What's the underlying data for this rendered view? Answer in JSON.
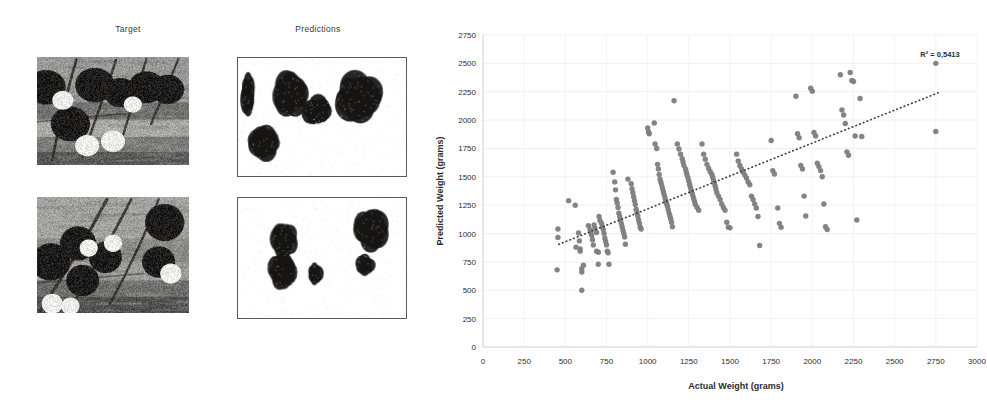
{
  "panels": {
    "columns": [
      {
        "id": "target",
        "label": "Target"
      },
      {
        "id": "predictions",
        "label": "Predictions"
      }
    ],
    "rows": [
      {
        "target_alt": "grayscale orchard photo with fruit clusters on branches",
        "prediction_alt": "binary segmentation mask with five dark blobs"
      },
      {
        "target_alt": "grayscale orchard photo with fruit clusters and foliage",
        "prediction_alt": "binary segmentation mask with four dark blobs"
      }
    ]
  },
  "chart_data": {
    "type": "scatter",
    "title": "",
    "xlabel": "Actual Weight (grams)",
    "ylabel": "Predicted Weight (grams)",
    "xlim": [
      0,
      3000
    ],
    "ylim": [
      0,
      2750
    ],
    "xticks": [
      0,
      250,
      500,
      750,
      1000,
      1250,
      1500,
      1750,
      2000,
      2250,
      2500,
      2750,
      3000
    ],
    "yticks": [
      0,
      250,
      500,
      750,
      1000,
      1250,
      1500,
      1750,
      2000,
      2250,
      2500,
      2750
    ],
    "grid": true,
    "legend": false,
    "annotation": "R² = 0,5413",
    "annotation_value": 0.5413,
    "point_color": "#7d7d7d",
    "trendline": {
      "style": "dotted",
      "color": "#3a3a3a",
      "x": [
        460,
        2780
      ],
      "y": [
        905,
        2250
      ]
    },
    "points": [
      [
        455,
        1040
      ],
      [
        455,
        965
      ],
      [
        450,
        680
      ],
      [
        520,
        1290
      ],
      [
        560,
        1250
      ],
      [
        565,
        880
      ],
      [
        580,
        1005
      ],
      [
        585,
        935
      ],
      [
        590,
        865
      ],
      [
        590,
        845
      ],
      [
        600,
        690
      ],
      [
        600,
        660
      ],
      [
        600,
        500
      ],
      [
        610,
        720
      ],
      [
        640,
        1070
      ],
      [
        650,
        1035
      ],
      [
        655,
        1010
      ],
      [
        660,
        985
      ],
      [
        665,
        945
      ],
      [
        670,
        900
      ],
      [
        675,
        1075
      ],
      [
        680,
        1045
      ],
      [
        690,
        1010
      ],
      [
        690,
        845
      ],
      [
        700,
        835
      ],
      [
        700,
        730
      ],
      [
        705,
        1150
      ],
      [
        710,
        1115
      ],
      [
        720,
        1090
      ],
      [
        725,
        1060
      ],
      [
        730,
        1035
      ],
      [
        735,
        1000
      ],
      [
        740,
        960
      ],
      [
        745,
        930
      ],
      [
        750,
        900
      ],
      [
        755,
        845
      ],
      [
        760,
        830
      ],
      [
        765,
        730
      ],
      [
        790,
        1540
      ],
      [
        800,
        1455
      ],
      [
        805,
        1385
      ],
      [
        810,
        1300
      ],
      [
        815,
        1270
      ],
      [
        820,
        1230
      ],
      [
        825,
        1180
      ],
      [
        830,
        1150
      ],
      [
        835,
        1120
      ],
      [
        840,
        1090
      ],
      [
        845,
        1060
      ],
      [
        850,
        1030
      ],
      [
        855,
        1000
      ],
      [
        860,
        970
      ],
      [
        865,
        905
      ],
      [
        880,
        1480
      ],
      [
        900,
        1440
      ],
      [
        905,
        1395
      ],
      [
        910,
        1360
      ],
      [
        915,
        1325
      ],
      [
        920,
        1290
      ],
      [
        925,
        1255
      ],
      [
        930,
        1215
      ],
      [
        935,
        1185
      ],
      [
        940,
        1155
      ],
      [
        945,
        1120
      ],
      [
        950,
        1090
      ],
      [
        955,
        1055
      ],
      [
        960,
        1040
      ],
      [
        1000,
        1930
      ],
      [
        1005,
        1895
      ],
      [
        1010,
        1880
      ],
      [
        1040,
        1975
      ],
      [
        1045,
        1790
      ],
      [
        1055,
        1750
      ],
      [
        1060,
        1610
      ],
      [
        1065,
        1570
      ],
      [
        1070,
        1520
      ],
      [
        1075,
        1480
      ],
      [
        1080,
        1455
      ],
      [
        1085,
        1430
      ],
      [
        1090,
        1400
      ],
      [
        1095,
        1370
      ],
      [
        1100,
        1345
      ],
      [
        1105,
        1315
      ],
      [
        1110,
        1290
      ],
      [
        1115,
        1265
      ],
      [
        1120,
        1240
      ],
      [
        1125,
        1210
      ],
      [
        1130,
        1180
      ],
      [
        1135,
        1155
      ],
      [
        1140,
        1130
      ],
      [
        1145,
        1100
      ],
      [
        1150,
        1060
      ],
      [
        1160,
        2170
      ],
      [
        1180,
        1790
      ],
      [
        1190,
        1745
      ],
      [
        1200,
        1700
      ],
      [
        1210,
        1660
      ],
      [
        1215,
        1630
      ],
      [
        1220,
        1600
      ],
      [
        1230,
        1570
      ],
      [
        1235,
        1540
      ],
      [
        1240,
        1515
      ],
      [
        1245,
        1490
      ],
      [
        1250,
        1460
      ],
      [
        1255,
        1430
      ],
      [
        1260,
        1405
      ],
      [
        1265,
        1380
      ],
      [
        1270,
        1355
      ],
      [
        1275,
        1330
      ],
      [
        1280,
        1305
      ],
      [
        1285,
        1280
      ],
      [
        1290,
        1255
      ],
      [
        1300,
        1230
      ],
      [
        1310,
        1205
      ],
      [
        1330,
        1790
      ],
      [
        1340,
        1700
      ],
      [
        1350,
        1655
      ],
      [
        1360,
        1610
      ],
      [
        1370,
        1575
      ],
      [
        1380,
        1545
      ],
      [
        1390,
        1520
      ],
      [
        1395,
        1495
      ],
      [
        1400,
        1470
      ],
      [
        1405,
        1445
      ],
      [
        1410,
        1420
      ],
      [
        1415,
        1390
      ],
      [
        1420,
        1360
      ],
      [
        1430,
        1330
      ],
      [
        1440,
        1300
      ],
      [
        1450,
        1260
      ],
      [
        1460,
        1230
      ],
      [
        1470,
        1205
      ],
      [
        1480,
        1100
      ],
      [
        1490,
        1055
      ],
      [
        1500,
        1050
      ],
      [
        1540,
        1700
      ],
      [
        1550,
        1640
      ],
      [
        1560,
        1600
      ],
      [
        1570,
        1570
      ],
      [
        1580,
        1540
      ],
      [
        1590,
        1515
      ],
      [
        1600,
        1490
      ],
      [
        1610,
        1455
      ],
      [
        1620,
        1430
      ],
      [
        1630,
        1330
      ],
      [
        1640,
        1300
      ],
      [
        1650,
        1260
      ],
      [
        1660,
        1225
      ],
      [
        1670,
        1150
      ],
      [
        1680,
        895
      ],
      [
        1750,
        1820
      ],
      [
        1760,
        1555
      ],
      [
        1770,
        1525
      ],
      [
        1790,
        1225
      ],
      [
        1800,
        1090
      ],
      [
        1810,
        1055
      ],
      [
        1900,
        2210
      ],
      [
        1910,
        1880
      ],
      [
        1920,
        1845
      ],
      [
        1930,
        1600
      ],
      [
        1940,
        1570
      ],
      [
        1950,
        1330
      ],
      [
        1960,
        1155
      ],
      [
        1990,
        2280
      ],
      [
        2000,
        2255
      ],
      [
        2010,
        1890
      ],
      [
        2020,
        1860
      ],
      [
        2030,
        1620
      ],
      [
        2040,
        1590
      ],
      [
        2050,
        1555
      ],
      [
        2060,
        1500
      ],
      [
        2070,
        1260
      ],
      [
        2080,
        1060
      ],
      [
        2090,
        1035
      ],
      [
        2170,
        2400
      ],
      [
        2180,
        2090
      ],
      [
        2190,
        2045
      ],
      [
        2200,
        1970
      ],
      [
        2210,
        1720
      ],
      [
        2220,
        1690
      ],
      [
        2230,
        2420
      ],
      [
        2240,
        2350
      ],
      [
        2250,
        2340
      ],
      [
        2260,
        1860
      ],
      [
        2270,
        1120
      ],
      [
        2290,
        2190
      ],
      [
        2300,
        1855
      ],
      [
        2750,
        2500
      ],
      [
        2750,
        1900
      ]
    ]
  }
}
